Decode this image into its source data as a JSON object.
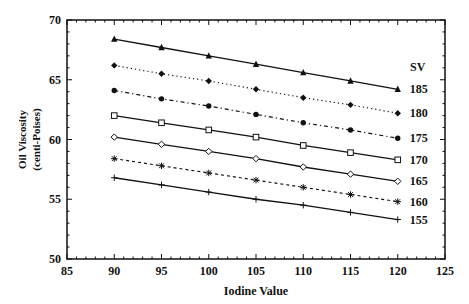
{
  "chart_data": {
    "type": "line",
    "title": "",
    "xlabel": "Iodine Value",
    "ylabel": "Oil Viscosity (centi-Poises)",
    "ylabel_lines": [
      "Oil Viscosity",
      "(centi-Poises)"
    ],
    "xlim": [
      85,
      125
    ],
    "ylim": [
      50,
      70
    ],
    "xticks": [
      85,
      90,
      95,
      100,
      105,
      110,
      115,
      120,
      125
    ],
    "yticks": [
      50,
      55,
      60,
      65,
      70
    ],
    "minor_tick_step": 1,
    "grid": false,
    "legend_title": "SV",
    "legend_position": "right, inline labels at line ends",
    "x": [
      90,
      95,
      100,
      105,
      110,
      115,
      120
    ],
    "series": [
      {
        "name": "185",
        "marker": "filled-triangle",
        "line": "solid",
        "values": [
          68.4,
          67.7,
          67.0,
          66.3,
          65.6,
          64.9,
          64.2
        ]
      },
      {
        "name": "180",
        "marker": "filled-diamond",
        "line": "dotted",
        "values": [
          66.2,
          65.5,
          64.9,
          64.2,
          63.5,
          62.9,
          62.2
        ]
      },
      {
        "name": "175",
        "marker": "filled-circle",
        "line": "dash-dot",
        "values": [
          64.1,
          63.4,
          62.8,
          62.1,
          61.4,
          60.8,
          60.1
        ]
      },
      {
        "name": "170",
        "marker": "open-square",
        "line": "solid",
        "values": [
          62.0,
          61.4,
          60.8,
          60.2,
          59.5,
          58.9,
          58.3
        ]
      },
      {
        "name": "165",
        "marker": "open-diamond",
        "line": "solid",
        "values": [
          60.2,
          59.6,
          59.0,
          58.4,
          57.7,
          57.1,
          56.5
        ]
      },
      {
        "name": "160",
        "marker": "asterisk",
        "line": "dashed",
        "values": [
          58.4,
          57.8,
          57.2,
          56.6,
          56.0,
          55.4,
          54.8
        ]
      },
      {
        "name": "155",
        "marker": "plus",
        "line": "solid",
        "values": [
          56.8,
          56.2,
          55.6,
          55.0,
          54.5,
          53.9,
          53.3
        ]
      }
    ]
  },
  "colors": {
    "ink": "#111111",
    "background": "#ffffff"
  }
}
